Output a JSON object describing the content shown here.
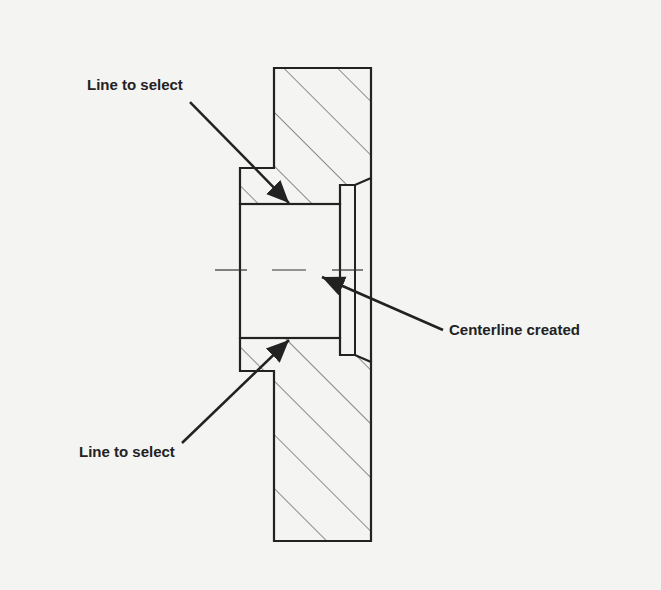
{
  "diagram": {
    "title": "",
    "labels": {
      "top": "Line to select",
      "bottom": "Line to select",
      "right": "Centerline created"
    },
    "colors": {
      "background": "#f4f4f2",
      "stroke": "#222222",
      "hatch": "#444444"
    }
  }
}
